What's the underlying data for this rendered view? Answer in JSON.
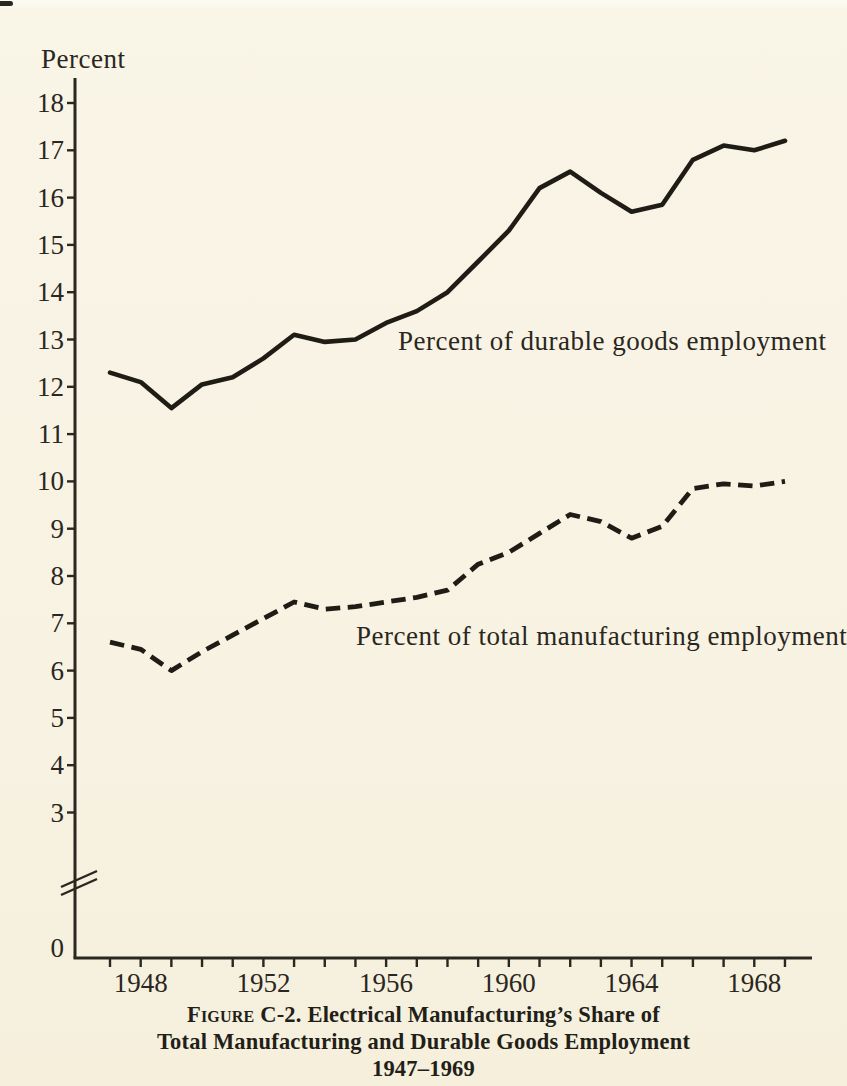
{
  "page": {
    "background_color": "#f8f3e4",
    "ink_color": "#2a2620"
  },
  "labels": {
    "y_unit": "Percent",
    "durable_series": "Percent of durable goods employment",
    "total_series": "Percent of total manufacturing employment"
  },
  "caption": {
    "figure_label": "Figure C-2.",
    "line1_rest": " Electrical Manufacturing’s Share of",
    "line2": "Total Manufacturing and Durable Goods Employment",
    "line3": "1947–1969"
  },
  "chart_data": {
    "type": "line",
    "xlabel": "",
    "ylabel": "Percent",
    "x": [
      1947,
      1948,
      1949,
      1950,
      1951,
      1952,
      1953,
      1954,
      1955,
      1956,
      1957,
      1958,
      1959,
      1960,
      1961,
      1962,
      1963,
      1964,
      1965,
      1966,
      1967,
      1968,
      1969
    ],
    "series": [
      {
        "name": "Percent of durable goods employment",
        "style": "solid",
        "values": [
          12.3,
          12.1,
          11.55,
          12.05,
          12.2,
          12.6,
          13.1,
          12.95,
          13.0,
          13.35,
          13.6,
          14.0,
          14.65,
          15.3,
          16.2,
          16.55,
          16.1,
          15.7,
          15.85,
          16.8,
          17.1,
          17.0,
          17.2
        ]
      },
      {
        "name": "Percent of total manufacturing employment",
        "style": "dashed",
        "values": [
          6.6,
          6.45,
          6.0,
          6.4,
          6.75,
          7.1,
          7.45,
          7.3,
          7.35,
          7.45,
          7.55,
          7.7,
          8.25,
          8.5,
          8.9,
          9.3,
          9.15,
          8.8,
          9.05,
          9.85,
          9.95,
          9.9,
          10.0
        ]
      }
    ],
    "y_axis": {
      "ticks": [
        18,
        17,
        16,
        15,
        14,
        13,
        12,
        11,
        10,
        9,
        8,
        7,
        6,
        5,
        4,
        3
      ],
      "origin_label": "0",
      "broken_axis": true,
      "range_shown": [
        3,
        18
      ]
    },
    "x_axis": {
      "tick_years": [
        1947,
        1948,
        1949,
        1950,
        1951,
        1952,
        1953,
        1954,
        1955,
        1956,
        1957,
        1958,
        1959,
        1960,
        1961,
        1962,
        1963,
        1964,
        1965,
        1966,
        1967,
        1968,
        1969
      ],
      "labeled_years": [
        "1948",
        "1952",
        "1956",
        "1960",
        "1964",
        "1968"
      ]
    },
    "legend_position": "inline-annotations",
    "grid": false
  }
}
